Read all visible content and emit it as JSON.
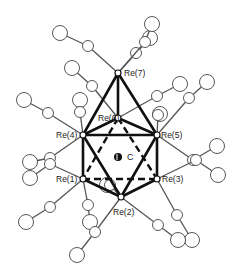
{
  "figure": {
    "type": "molecular-structure",
    "atoms": [
      {
        "id": "Re7",
        "label": "Re(7)",
        "x": 118,
        "y": 73,
        "lx": 124,
        "ly": 76
      },
      {
        "id": "Re6",
        "label": "Re(6)",
        "x": 118,
        "y": 118,
        "lx": 98,
        "ly": 121
      },
      {
        "id": "Re4",
        "label": "Re(4)",
        "x": 83,
        "y": 135,
        "lx": 56,
        "ly": 138
      },
      {
        "id": "Re5",
        "label": "Re(5)",
        "x": 157,
        "y": 135,
        "lx": 161,
        "ly": 138
      },
      {
        "id": "Re1",
        "label": "Re(1)",
        "x": 83,
        "y": 179,
        "lx": 56,
        "ly": 182
      },
      {
        "id": "Re3",
        "label": "Re(3)",
        "x": 157,
        "y": 179,
        "lx": 162,
        "ly": 182
      },
      {
        "id": "Re2",
        "label": "Re(2)",
        "x": 121,
        "y": 197,
        "lx": 113,
        "ly": 215
      }
    ],
    "carbide": {
      "label": "C",
      "x": 118,
      "y": 157,
      "lx": 127,
      "ly": 160
    },
    "bonds_bold": [
      [
        "Re7",
        "Re4"
      ],
      [
        "Re7",
        "Re5"
      ],
      [
        "Re7",
        "Re6"
      ],
      [
        "Re4",
        "Re5"
      ],
      [
        "Re4",
        "Re1"
      ],
      [
        "Re5",
        "Re3"
      ],
      [
        "Re4",
        "Re2"
      ],
      [
        "Re5",
        "Re2"
      ],
      [
        "Re1",
        "Re2"
      ],
      [
        "Re3",
        "Re2"
      ],
      [
        "Re6",
        "Re4"
      ],
      [
        "Re6",
        "Re5"
      ]
    ],
    "bonds_dashed": [
      [
        "Re1",
        "Re3"
      ],
      [
        "Re6",
        "Re1"
      ],
      [
        "Re6",
        "Re3"
      ]
    ],
    "ligands": [
      {
        "from": "Re7",
        "c": [
          88,
          46
        ],
        "o": [
          60,
          33
        ]
      },
      {
        "from": "Re7",
        "c": [
          136,
          53
        ],
        "o": [
          150,
          38
        ]
      },
      {
        "from": "Re7",
        "c": [
          145,
          42
        ],
        "o": [
          152,
          24
        ]
      },
      {
        "from": "Re6",
        "c": [
          92,
          86
        ],
        "o": [
          72,
          68
        ]
      },
      {
        "from": "Re6",
        "c": [
          157,
          96
        ],
        "o": [
          180,
          84
        ]
      },
      {
        "from": "Re4",
        "c": [
          48,
          113
        ],
        "o": [
          24,
          100
        ]
      },
      {
        "from": "Re4",
        "c": [
          80,
          112
        ],
        "o": [
          80,
          100
        ]
      },
      {
        "from": "Re4",
        "c": [
          50,
          158
        ],
        "o": [
          30,
          162
        ]
      },
      {
        "from": "Re5",
        "c": [
          189,
          98
        ],
        "o": [
          207,
          82
        ]
      },
      {
        "from": "Re5",
        "c": [
          158,
          115
        ],
        "o": [
          160,
          114
        ]
      },
      {
        "from": "Re5",
        "c": [
          193,
          160
        ],
        "o": [
          217,
          146
        ]
      },
      {
        "from": "Re1",
        "c": [
          50,
          164
        ],
        "o": [
          30,
          178
        ]
      },
      {
        "from": "Re1",
        "c": [
          50,
          207
        ],
        "o": [
          26,
          222
        ]
      },
      {
        "from": "Re1",
        "c": [
          88,
          205
        ],
        "o": [
          90,
          222
        ]
      },
      {
        "from": "Re3",
        "c": [
          196,
          160
        ],
        "o": [
          218,
          175
        ]
      },
      {
        "from": "Re3",
        "c": [
          177,
          215
        ],
        "o": [
          192,
          240
        ]
      },
      {
        "from": "Re2",
        "c": [
          95,
          232
        ],
        "o": [
          77,
          255
        ]
      },
      {
        "from": "Re2",
        "c": [
          158,
          225
        ],
        "o": [
          178,
          240
        ]
      },
      {
        "from": "Re2",
        "c": [
          110,
          185
        ],
        "o": [
          107,
          185
        ]
      }
    ]
  }
}
